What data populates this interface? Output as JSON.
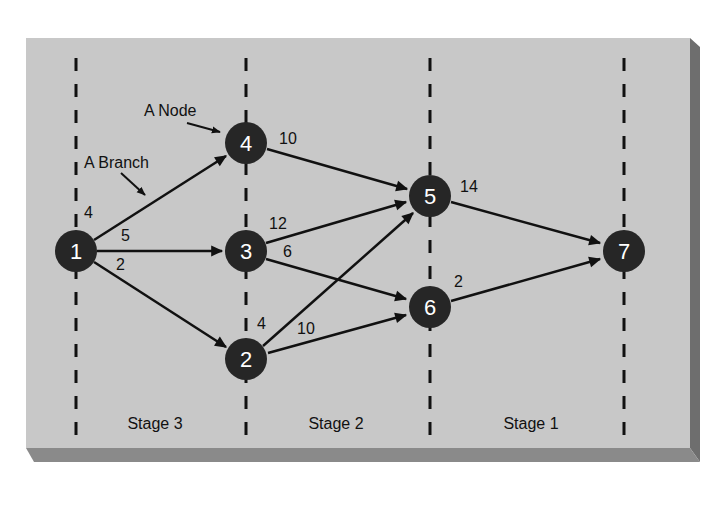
{
  "diagram": {
    "type": "staged network (dynamic programming)",
    "colors": {
      "background": "#ffffff",
      "board": "#c8c8c8",
      "board_shadow_right": "#6e6e6e",
      "board_shadow_bottom": "#8a8a8a",
      "node_fill": "#262626",
      "node_text": "#ffffff",
      "line": "#111111"
    },
    "annotations": {
      "node": "A Node",
      "branch": "A Branch"
    },
    "stages": [
      {
        "label": "Stage 3"
      },
      {
        "label": "Stage 2"
      },
      {
        "label": "Stage 1"
      }
    ],
    "nodes": [
      {
        "id": "1",
        "label": "1"
      },
      {
        "id": "2",
        "label": "2"
      },
      {
        "id": "3",
        "label": "3"
      },
      {
        "id": "4",
        "label": "4"
      },
      {
        "id": "5",
        "label": "5"
      },
      {
        "id": "6",
        "label": "6"
      },
      {
        "id": "7",
        "label": "7"
      }
    ],
    "edges": [
      {
        "from": "1",
        "to": "4",
        "weight": "4"
      },
      {
        "from": "1",
        "to": "3",
        "weight": "5"
      },
      {
        "from": "1",
        "to": "2",
        "weight": "2"
      },
      {
        "from": "4",
        "to": "5",
        "weight": "10"
      },
      {
        "from": "3",
        "to": "5",
        "weight": "12"
      },
      {
        "from": "3",
        "to": "6",
        "weight": "6"
      },
      {
        "from": "2",
        "to": "5",
        "weight": "4"
      },
      {
        "from": "2",
        "to": "6",
        "weight": "10"
      },
      {
        "from": "5",
        "to": "7",
        "weight": "14"
      },
      {
        "from": "6",
        "to": "7",
        "weight": "2"
      }
    ]
  }
}
